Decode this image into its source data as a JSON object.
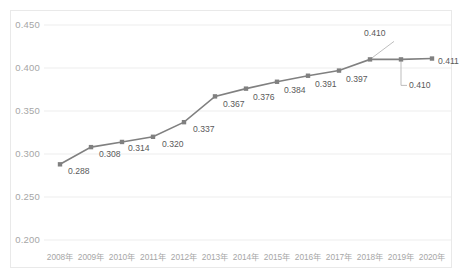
{
  "chart_data": {
    "type": "line",
    "title": "",
    "subtitle": "",
    "xlabel": "",
    "ylabel": "",
    "categories": [
      "2008年",
      "2009年",
      "2010年",
      "2011年",
      "2012年",
      "2013年",
      "2014年",
      "2015年",
      "2016年",
      "2017年",
      "2018年",
      "2019年",
      "2020年"
    ],
    "values": [
      0.288,
      0.308,
      0.314,
      0.32,
      0.337,
      0.367,
      0.376,
      0.384,
      0.391,
      0.397,
      0.41,
      0.41,
      0.411
    ],
    "point_labels": [
      "0.288",
      "0.308",
      "0.314",
      "0.320",
      "0.337",
      "0.367",
      "0.376",
      "0.384",
      "0.391",
      "0.397",
      "0.410",
      "0.410",
      "0.411"
    ],
    "ylim": [
      0.2,
      0.45
    ],
    "yticks": [
      0.2,
      0.25,
      0.3,
      0.35,
      0.4,
      0.45
    ],
    "ytick_labels": [
      "0.200",
      "0.250",
      "0.300",
      "0.350",
      "0.400",
      "0.450"
    ],
    "grid": "horizontal",
    "legend": "none",
    "series_color": "#808080",
    "marker": "square",
    "marker_color": "#808080",
    "gridline_color": "#ededed",
    "label_color": "#a6a6a6",
    "datalabel_color": "#5a5a5a",
    "leader_lines": [
      {
        "label": "0.410",
        "attached_to_category": "2018年",
        "direction": "up-left"
      },
      {
        "label": "0.410",
        "attached_to_category": "2019年",
        "direction": "down-right"
      }
    ]
  }
}
